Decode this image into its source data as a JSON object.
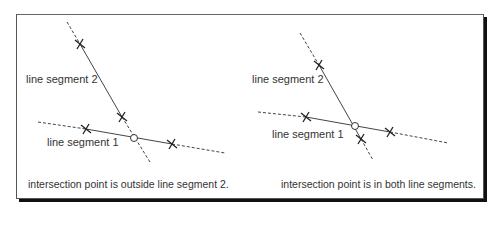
{
  "left_panel": {
    "label_segment_2": "line segment 2",
    "label_segment_1": "line segment 1",
    "caption": "intersection point is outside line segment 2."
  },
  "right_panel": {
    "label_segment_2": "line segment 2",
    "label_segment_1": "line segment 1",
    "caption": "intersection point is in both line segments."
  },
  "colors": {
    "line": "#444444",
    "frame": "#555555",
    "shadow": "#111111",
    "text": "#333333"
  }
}
